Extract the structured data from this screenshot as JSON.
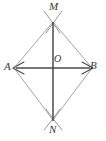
{
  "figure": {
    "kind": "geometry-construction-diagram",
    "canvas": {
      "width": 106,
      "height": 141
    },
    "colors": {
      "background": "#ffffff",
      "diagonal": "#4a4a4a",
      "side": "#9a9a9a",
      "arc": "#8a8a8a",
      "label": "#3a3a3a"
    },
    "points": [
      {
        "id": "M",
        "label": "M",
        "x": 53,
        "y": 22
      },
      {
        "id": "A",
        "label": "A",
        "x": 14,
        "y": 68
      },
      {
        "id": "O",
        "label": "O",
        "x": 53,
        "y": 68
      },
      {
        "id": "B",
        "label": "B",
        "x": 92,
        "y": 68
      },
      {
        "id": "N",
        "label": "N",
        "x": 53,
        "y": 120
      }
    ],
    "segments": [
      {
        "id": "AM",
        "from": "A",
        "to": "M",
        "style": "thin-gray"
      },
      {
        "id": "MB",
        "from": "M",
        "to": "B",
        "style": "thin-gray"
      },
      {
        "id": "BN",
        "from": "B",
        "to": "N",
        "style": "thin-gray"
      },
      {
        "id": "NA",
        "from": "N",
        "to": "A",
        "style": "thin-gray"
      },
      {
        "id": "AB",
        "from": "A",
        "to": "B",
        "style": "dark-double-arrow"
      },
      {
        "id": "MN",
        "from": "M",
        "to": "N",
        "style": "dark"
      }
    ],
    "arcs": [
      {
        "id": "arc-M-left",
        "center": "A",
        "near": "M"
      },
      {
        "id": "arc-M-right",
        "center": "B",
        "near": "M"
      },
      {
        "id": "arc-N-left",
        "center": "A",
        "near": "N"
      },
      {
        "id": "arc-N-right",
        "center": "B",
        "near": "N"
      }
    ],
    "labels": {
      "M": "M",
      "N": "N",
      "A": "A",
      "B": "B",
      "O": "O"
    }
  }
}
